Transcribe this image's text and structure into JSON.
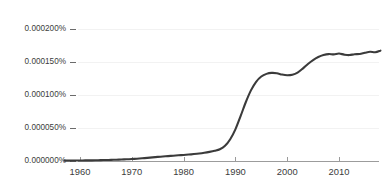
{
  "chart_data": {
    "type": "line",
    "title": "",
    "subtitle": "",
    "xlabel": "",
    "ylabel": "",
    "grid": true,
    "legend_position": "none",
    "xlim": [
      1957,
      2019
    ],
    "ylim": [
      0.0,
      0.000212
    ],
    "x_tick_labels": [
      "1960",
      "1970",
      "1980",
      "1990",
      "2000",
      "2010"
    ],
    "x_ticks": [
      1960,
      1970,
      1980,
      1990,
      2000,
      2010
    ],
    "y_tick_labels": [
      "0.000000%",
      "0.000050%",
      "0.000100%",
      "0.000150%",
      "0.000200%"
    ],
    "y_ticks": [
      0.0,
      5e-05,
      0.0001,
      0.00015,
      0.0002
    ],
    "unit": "percent",
    "series": [
      {
        "name": "ngram",
        "color": "#3b3b3b",
        "x": [
          1957,
          1958,
          1959,
          1960,
          1961,
          1962,
          1963,
          1964,
          1965,
          1966,
          1967,
          1968,
          1969,
          1970,
          1971,
          1972,
          1973,
          1974,
          1975,
          1976,
          1977,
          1978,
          1979,
          1980,
          1981,
          1982,
          1983,
          1984,
          1985,
          1986,
          1987,
          1988,
          1989,
          1990,
          1991,
          1992,
          1993,
          1994,
          1995,
          1996,
          1997,
          1998,
          1999,
          2000,
          2001,
          2002,
          2003,
          2004,
          2005,
          2006,
          2007,
          2008,
          2009,
          2010,
          2011,
          2012,
          2013,
          2014,
          2015,
          2016,
          2017,
          2018
        ],
        "values": [
          5e-07,
          6e-07,
          7e-07,
          8e-07,
          9e-07,
          1e-06,
          1.1e-06,
          1.3e-06,
          1.5e-06,
          1.7e-06,
          2e-06,
          2.3e-06,
          2.6e-06,
          3e-06,
          3.5e-06,
          4.1e-06,
          4.8e-06,
          5.5e-06,
          6.2e-06,
          6.8e-06,
          7.4e-06,
          8e-06,
          8.6e-06,
          9.2e-06,
          9.8e-06,
          1.05e-05,
          1.13e-05,
          1.24e-05,
          1.38e-05,
          1.55e-05,
          1.78e-05,
          2.3e-05,
          3.3e-05,
          4.8e-05,
          6.8e-05,
          8.9e-05,
          0.000107,
          0.00012,
          0.000128,
          0.000132,
          0.0001335,
          0.000133,
          0.000131,
          0.00013,
          0.0001308,
          0.000134,
          0.00014,
          0.000147,
          0.000153,
          0.0001575,
          0.0001605,
          0.000162,
          0.0001615,
          0.0001628,
          0.0001612,
          0.0001605,
          0.0001618,
          0.0001622,
          0.000164,
          0.0001655,
          0.0001648,
          0.0001672
        ]
      }
    ]
  },
  "axes": {
    "y_labels": [
      {
        "text": "0.000200%",
        "value": 0.0002
      },
      {
        "text": "0.000150%",
        "value": 0.00015
      },
      {
        "text": "0.000100%",
        "value": 0.0001
      },
      {
        "text": "0.000050%",
        "value": 5e-05
      },
      {
        "text": "0.000000%",
        "value": 0.0
      }
    ],
    "x_labels": [
      {
        "text": "1960",
        "value": 1960
      },
      {
        "text": "1970",
        "value": 1970
      },
      {
        "text": "1980",
        "value": 1980
      },
      {
        "text": "1990",
        "value": 1990
      },
      {
        "text": "2000",
        "value": 2000
      },
      {
        "text": "2010",
        "value": 2010
      }
    ]
  },
  "style": {
    "background": "#ffffff",
    "line_color": "#3b3b3b",
    "axis_color": "#9c9c9c",
    "grid_color": "#f2f2f2",
    "tick_text_color": "#3c3c3c"
  }
}
